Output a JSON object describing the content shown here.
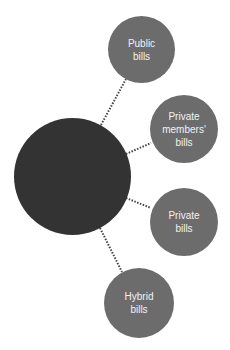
{
  "diagram": {
    "hub": {
      "label": "",
      "color": "#333333"
    },
    "satellite_color": "#6c6c6c",
    "connector_style": "dotted",
    "nodes": [
      {
        "id": "public",
        "label": "Public\nbills"
      },
      {
        "id": "private-members",
        "label": "Private\nmembers'\nbills"
      },
      {
        "id": "private",
        "label": "Private\nbills"
      },
      {
        "id": "hybrid",
        "label": "Hybrid\nbills"
      }
    ]
  }
}
